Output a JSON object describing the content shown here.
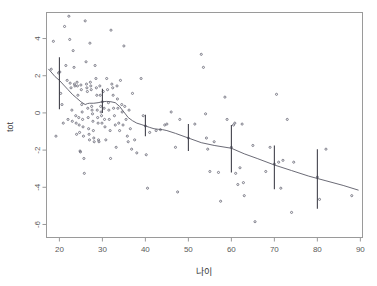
{
  "chart_data": {
    "type": "scatter",
    "title": "",
    "subtitle": "",
    "xlabel": "나이",
    "ylabel": "tot",
    "xlim": [
      17,
      90.5
    ],
    "ylim": [
      -6.7,
      5.4
    ],
    "grid": false,
    "legend": "none",
    "xticks": [
      20,
      30,
      40,
      50,
      60,
      70,
      80,
      90
    ],
    "xtick_labels": [
      "20",
      "30",
      "40",
      "50",
      "60",
      "70",
      "80",
      "90"
    ],
    "yticks": [
      4,
      2,
      0,
      -2,
      -4,
      -6
    ],
    "ytick_labels": [
      "4",
      "2",
      "0",
      "-2",
      "-4",
      "-6"
    ],
    "point_marker": "dot",
    "point_color": "#6b6b78",
    "curve_color": "#5a5a66",
    "errorbar_color": "#3a3a44",
    "frame_color": "#9a9a9a",
    "series": [
      {
        "name": "observations",
        "type": "scatter",
        "points": [
          [
            18.1,
            2.35
          ],
          [
            18.6,
            3.85
          ],
          [
            19.2,
            -1.25
          ],
          [
            19.8,
            2.15
          ],
          [
            20.1,
            2.2
          ],
          [
            20.3,
            1.05
          ],
          [
            20.6,
            0.45
          ],
          [
            20.9,
            -0.55
          ],
          [
            21.2,
            4.65
          ],
          [
            21.5,
            2.55
          ],
          [
            21.8,
            1.75
          ],
          [
            22.0,
            -0.35
          ],
          [
            22.2,
            5.2
          ],
          [
            22.4,
            3.95
          ],
          [
            22.5,
            1.6
          ],
          [
            22.7,
            1.35
          ],
          [
            22.9,
            0.15
          ],
          [
            23.0,
            -0.45
          ],
          [
            23.2,
            3.35
          ],
          [
            23.4,
            2.45
          ],
          [
            23.5,
            1.55
          ],
          [
            23.6,
            1.45
          ],
          [
            23.8,
            -0.15
          ],
          [
            23.9,
            -0.55
          ],
          [
            24.0,
            -1.15
          ],
          [
            24.1,
            1.65
          ],
          [
            24.2,
            1.45
          ],
          [
            24.3,
            0.95
          ],
          [
            24.5,
            -0.25
          ],
          [
            24.6,
            -0.65
          ],
          [
            24.7,
            -1.05
          ],
          [
            24.8,
            -2.05
          ],
          [
            24.9,
            -2.1
          ],
          [
            25.0,
            1.5
          ],
          [
            25.1,
            1.25
          ],
          [
            25.2,
            0.45
          ],
          [
            25.3,
            0.05
          ],
          [
            25.4,
            -0.35
          ],
          [
            25.5,
            -0.75
          ],
          [
            25.6,
            -1.25
          ],
          [
            25.7,
            -2.45
          ],
          [
            25.8,
            -3.25
          ],
          [
            26.0,
            4.95
          ],
          [
            26.2,
            2.75
          ],
          [
            26.3,
            1.55
          ],
          [
            26.4,
            1.35
          ],
          [
            26.5,
            1.15
          ],
          [
            26.6,
            0.25
          ],
          [
            26.7,
            -0.25
          ],
          [
            26.8,
            -0.85
          ],
          [
            26.9,
            -1.15
          ],
          [
            27.0,
            -1.45
          ],
          [
            27.1,
            3.75
          ],
          [
            27.2,
            1.65
          ],
          [
            27.3,
            1.45
          ],
          [
            27.4,
            1.25
          ],
          [
            27.5,
            0.35
          ],
          [
            27.6,
            0.15
          ],
          [
            27.7,
            -0.05
          ],
          [
            27.8,
            -0.45
          ],
          [
            27.9,
            -0.95
          ],
          [
            28.0,
            -1.35
          ],
          [
            28.1,
            -1.55
          ],
          [
            28.3,
            2.55
          ],
          [
            28.5,
            1.85
          ],
          [
            28.6,
            1.35
          ],
          [
            28.7,
            0.95
          ],
          [
            28.8,
            0.15
          ],
          [
            28.9,
            -0.25
          ],
          [
            29.0,
            -0.55
          ],
          [
            29.1,
            -1.45
          ],
          [
            29.2,
            -1.55
          ],
          [
            29.4,
            1.45
          ],
          [
            29.5,
            0.95
          ],
          [
            29.6,
            0.35
          ],
          [
            29.7,
            0.05
          ],
          [
            29.8,
            -0.15
          ],
          [
            29.9,
            -0.55
          ],
          [
            30.0,
            0.6
          ],
          [
            30.2,
            1.15
          ],
          [
            30.4,
            0.25
          ],
          [
            30.5,
            -0.35
          ],
          [
            30.6,
            -0.75
          ],
          [
            30.8,
            -1.45
          ],
          [
            31.0,
            1.85
          ],
          [
            31.2,
            1.25
          ],
          [
            31.4,
            0.55
          ],
          [
            31.5,
            0.15
          ],
          [
            31.6,
            -0.35
          ],
          [
            31.8,
            -0.95
          ],
          [
            31.9,
            -2.45
          ],
          [
            32.0,
            4.45
          ],
          [
            32.2,
            1.55
          ],
          [
            32.4,
            1.35
          ],
          [
            32.5,
            0.95
          ],
          [
            32.6,
            0.25
          ],
          [
            32.8,
            -0.15
          ],
          [
            33.0,
            -0.65
          ],
          [
            33.2,
            -1.85
          ],
          [
            33.4,
            1.45
          ],
          [
            33.5,
            0.75
          ],
          [
            33.6,
            0.25
          ],
          [
            33.8,
            -0.55
          ],
          [
            34.0,
            -0.95
          ],
          [
            34.2,
            1.75
          ],
          [
            34.5,
            0.45
          ],
          [
            34.6,
            0.05
          ],
          [
            34.8,
            -0.65
          ],
          [
            35.0,
            3.6
          ],
          [
            35.2,
            0.35
          ],
          [
            35.5,
            -0.35
          ],
          [
            35.8,
            -1.25
          ],
          [
            36.0,
            -1.55
          ],
          [
            36.2,
            0.15
          ],
          [
            36.5,
            -0.85
          ],
          [
            36.8,
            -1.95
          ],
          [
            37.0,
            1.05
          ],
          [
            37.5,
            -1.45
          ],
          [
            38.0,
            -2.15
          ],
          [
            39.0,
            1.85
          ],
          [
            39.5,
            -0.15
          ],
          [
            40.0,
            -0.7
          ],
          [
            40.2,
            -2.25
          ],
          [
            40.5,
            -4.05
          ],
          [
            41.0,
            -1.05
          ],
          [
            42.5,
            -0.95
          ],
          [
            43.5,
            -0.9
          ],
          [
            44.5,
            -0.65
          ],
          [
            45.0,
            -0.6
          ],
          [
            46.0,
            0.05
          ],
          [
            47.0,
            -1.85
          ],
          [
            47.5,
            -4.25
          ],
          [
            48.0,
            -0.35
          ],
          [
            50.0,
            -1.35
          ],
          [
            51.5,
            -0.6
          ],
          [
            53.0,
            3.15
          ],
          [
            53.5,
            2.45
          ],
          [
            54.0,
            -0.05
          ],
          [
            54.2,
            -1.35
          ],
          [
            54.5,
            -1.95
          ],
          [
            55.0,
            -3.15
          ],
          [
            56.0,
            -1.55
          ],
          [
            57.0,
            -3.2
          ],
          [
            57.5,
            -4.75
          ],
          [
            58.5,
            0.85
          ],
          [
            59.0,
            -0.35
          ],
          [
            60.0,
            -1.85
          ],
          [
            60.5,
            -0.65
          ],
          [
            60.8,
            -0.55
          ],
          [
            61.0,
            -3.25
          ],
          [
            61.5,
            -3.85
          ],
          [
            62.0,
            -2.95
          ],
          [
            62.5,
            -0.6
          ],
          [
            62.8,
            -3.75
          ],
          [
            63.0,
            -4.45
          ],
          [
            65.0,
            -1.75
          ],
          [
            65.5,
            -5.85
          ],
          [
            68.0,
            -3.15
          ],
          [
            69.0,
            -1.85
          ],
          [
            70.0,
            -2.75
          ],
          [
            70.5,
            1.0
          ],
          [
            71.0,
            -2.65
          ],
          [
            71.5,
            -4.05
          ],
          [
            72.0,
            -2.55
          ],
          [
            73.0,
            -0.35
          ],
          [
            74.0,
            -5.35
          ],
          [
            74.5,
            -2.65
          ],
          [
            80.0,
            -3.45
          ],
          [
            80.5,
            -4.65
          ],
          [
            82.0,
            -1.95
          ],
          [
            88.0,
            -4.45
          ]
        ]
      },
      {
        "name": "smooth-fit",
        "type": "line",
        "points": [
          [
            17.5,
            2.35
          ],
          [
            19.0,
            1.95
          ],
          [
            20.0,
            1.75
          ],
          [
            21.0,
            1.5
          ],
          [
            22.0,
            1.25
          ],
          [
            23.0,
            1.0
          ],
          [
            24.0,
            0.8
          ],
          [
            25.0,
            0.6
          ],
          [
            26.0,
            0.45
          ],
          [
            26.5,
            0.5
          ],
          [
            27.0,
            0.52
          ],
          [
            28.0,
            0.52
          ],
          [
            29.0,
            0.55
          ],
          [
            30.0,
            0.6
          ],
          [
            31.0,
            0.62
          ],
          [
            32.0,
            0.6
          ],
          [
            33.0,
            0.55
          ],
          [
            34.0,
            0.35
          ],
          [
            35.0,
            0.05
          ],
          [
            36.0,
            -0.25
          ],
          [
            37.0,
            -0.42
          ],
          [
            38.0,
            -0.55
          ],
          [
            39.0,
            -0.62
          ],
          [
            40.0,
            -0.7
          ],
          [
            41.0,
            -0.78
          ],
          [
            42.0,
            -0.85
          ],
          [
            43.0,
            -0.88
          ],
          [
            44.0,
            -0.9
          ],
          [
            45.0,
            -0.95
          ],
          [
            47.0,
            -1.1
          ],
          [
            50.0,
            -1.35
          ],
          [
            53.0,
            -1.6
          ],
          [
            56.0,
            -1.75
          ],
          [
            60.0,
            -1.9
          ],
          [
            63.0,
            -2.2
          ],
          [
            66.0,
            -2.45
          ],
          [
            70.0,
            -2.8
          ],
          [
            74.0,
            -3.1
          ],
          [
            78.0,
            -3.4
          ],
          [
            82.0,
            -3.65
          ],
          [
            86.0,
            -3.9
          ],
          [
            89.5,
            -4.15
          ]
        ]
      }
    ],
    "error_bars": [
      {
        "x": 20,
        "center": 1.75,
        "lower": 0.2,
        "upper": 3.0
      },
      {
        "x": 30,
        "center": 0.6,
        "lower": 0.0,
        "upper": 1.3
      },
      {
        "x": 40,
        "center": -0.7,
        "lower": -1.25,
        "upper": -0.1
      },
      {
        "x": 50,
        "center": -1.35,
        "lower": -2.05,
        "upper": -0.6
      },
      {
        "x": 60,
        "center": -1.9,
        "lower": -3.2,
        "upper": -0.65
      },
      {
        "x": 70,
        "center": -2.8,
        "lower": -4.1,
        "upper": -1.75
      },
      {
        "x": 80,
        "center": -3.55,
        "lower": -5.15,
        "upper": -1.95
      }
    ]
  },
  "figure": {
    "background_color": "#ffffff",
    "axis_title_x": "나이",
    "axis_title_y": "tot"
  }
}
